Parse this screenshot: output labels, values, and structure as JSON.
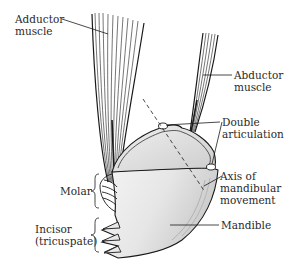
{
  "diagram": {
    "colors": {
      "background": "#ffffff",
      "line": "#1a1a1a",
      "shading": "#cfcfcf",
      "text": "#2a2a2a"
    },
    "labels": {
      "adductor": {
        "line1": "Adductor",
        "line2": "muscle"
      },
      "abductor": {
        "line1": "Abductor",
        "line2": "muscle"
      },
      "double_articulation": {
        "line1": "Double",
        "line2": "articulation"
      },
      "axis": {
        "line1": "Axis of",
        "line2": "mandibular",
        "line3": "movement"
      },
      "molar": {
        "line1": "Molar"
      },
      "incisor": {
        "line1": "Incisor",
        "line2": "(tricuspate)"
      },
      "mandible": {
        "line1": "Mandible"
      }
    }
  }
}
